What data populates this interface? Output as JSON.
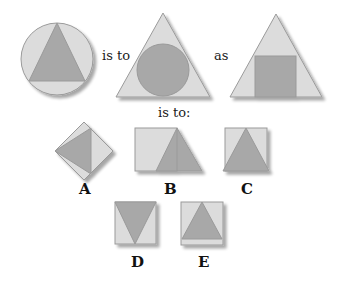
{
  "analogy": {
    "word_is_to": "is to",
    "word_as": "as",
    "word_is_to_colon": "is to:"
  },
  "options": [
    {
      "letter": "A"
    },
    {
      "letter": "B"
    },
    {
      "letter": "C"
    },
    {
      "letter": "D"
    },
    {
      "letter": "E"
    }
  ],
  "colors": {
    "light_fill": "#dcdcdc",
    "dark_fill": "#a8a8a8",
    "stroke": "#9a9a9a",
    "shadow": "#c8c8c8"
  }
}
